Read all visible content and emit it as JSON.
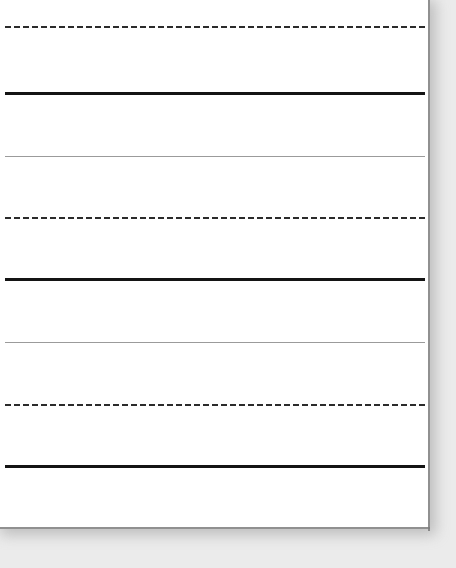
{
  "document": {
    "kind": "lined-handwriting-paper",
    "title": "Lined Handwriting Paper",
    "orientation": "portrait",
    "visible_text": "",
    "description": "Blank primary-ruled writing paper sheet with no written content"
  },
  "canvas": {
    "width": 456,
    "height": 568,
    "background_color": "#ebebeb"
  },
  "paper": {
    "left": 0,
    "top": 0,
    "width": 430,
    "height": 529,
    "fill_color": "#ffffff",
    "edge_color": "#7d7d7d",
    "shadow_color": "#9a9a9a"
  },
  "ruling": {
    "line_start_x": 5,
    "line_end_x": 425,
    "dash_length": 6,
    "dash_gap": 3,
    "colors": {
      "baseline": "#141414",
      "midline": "#9b9b9b",
      "dashed": "#2b2b2b"
    },
    "lines": [
      {
        "id": "rule-1",
        "style": "dashed",
        "y": 27,
        "thickness": 2,
        "color": "#2b2b2b"
      },
      {
        "id": "rule-2",
        "style": "solid-bold",
        "y": 93,
        "thickness": 3,
        "color": "#141414"
      },
      {
        "id": "rule-3",
        "style": "solid-thin",
        "y": 156,
        "thickness": 1,
        "color": "#9b9b9b"
      },
      {
        "id": "rule-4",
        "style": "dashed",
        "y": 218,
        "thickness": 2,
        "color": "#2b2b2b"
      },
      {
        "id": "rule-5",
        "style": "solid-bold",
        "y": 279,
        "thickness": 3,
        "color": "#141414"
      },
      {
        "id": "rule-6",
        "style": "solid-thin",
        "y": 342,
        "thickness": 1,
        "color": "#9b9b9b"
      },
      {
        "id": "rule-7",
        "style": "dashed",
        "y": 405,
        "thickness": 2,
        "color": "#2b2b2b"
      },
      {
        "id": "rule-8",
        "style": "solid-bold",
        "y": 466,
        "thickness": 3,
        "color": "#141414"
      }
    ]
  }
}
